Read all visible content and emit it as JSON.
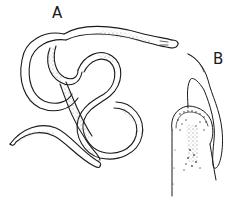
{
  "figure": {
    "labels": {
      "a": "A",
      "b": "B"
    },
    "colors": {
      "background": "#ffffff",
      "ink": "#1a1a1a",
      "stipple": "#6b6b6b"
    },
    "panels": [
      {
        "id": "A",
        "subject": "coiled worm, whole body"
      },
      {
        "id": "B",
        "subject": "enlarged anterior end with slender filament"
      }
    ]
  }
}
